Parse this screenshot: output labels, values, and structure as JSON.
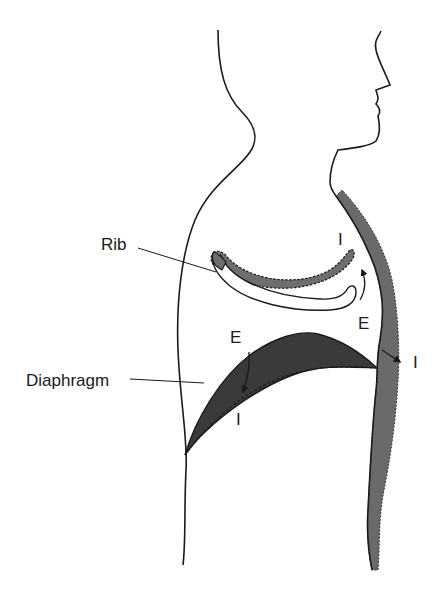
{
  "figure": {
    "labels": {
      "rib": "Rib",
      "diaphragm": "Diaphragm",
      "rib_inspiration": "I",
      "rib_expiration": "E",
      "diaphragm_expiration": "E",
      "diaphragm_inspiration": "I",
      "chest_inspiration": "I"
    },
    "colors": {
      "outline": "#1a1a1a",
      "rib_shade": "#6e6e6e",
      "diaphragm_shade": "#3a3a3a",
      "chest_wall_shade": "#6a6a6a",
      "background": "#ffffff"
    }
  }
}
